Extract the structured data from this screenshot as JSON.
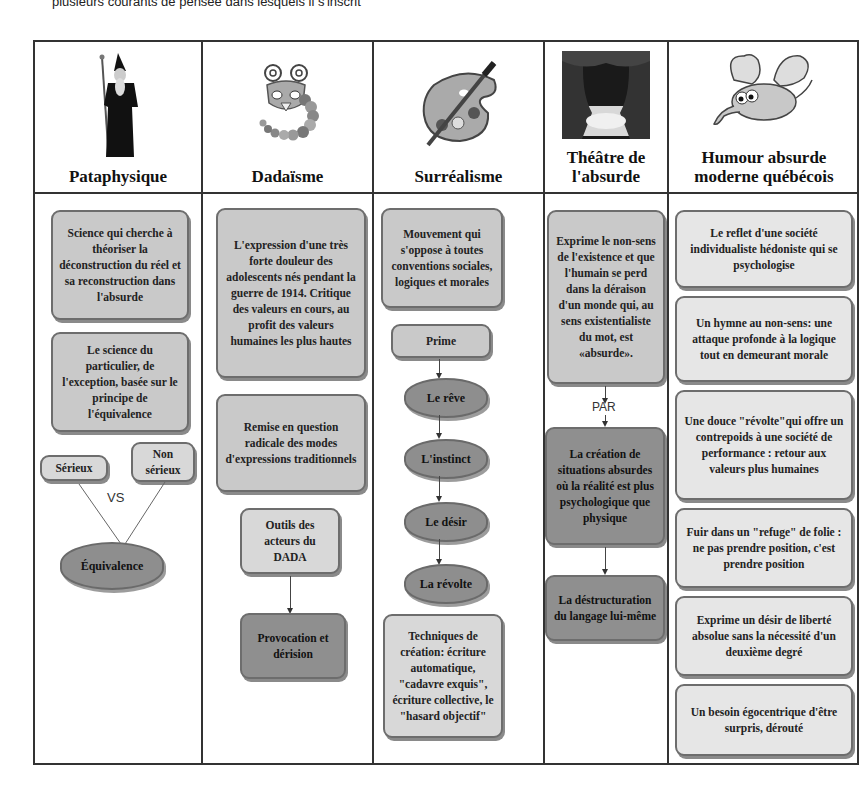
{
  "caption": "plusieurs courants de pensée dans lesquels il s'inscrit",
  "columns": [
    {
      "title": "Pataphysique",
      "icon": "wizard-figure-icon",
      "boxes": [
        "Science qui cherche à théoriser la déconstruction du réel et sa reconstruction dans l'absurde",
        "Le science du particulier, de l'exception, basée sur le principe de l'équivalence"
      ],
      "vs": {
        "left": "Sérieux",
        "right": "Non sérieux",
        "label": "VS",
        "result": "Équivalence"
      }
    },
    {
      "title": "Dadaïsme",
      "icon": "caterpillar-creature-icon",
      "boxes": [
        "L'expression d'une très forte douleur des adolescents nés pendant la guerre de 1914. Critique des valeurs en cours, au profit des valeurs humaines les plus hautes",
        "Remise en question radicale des modes d'expressions traditionnels"
      ],
      "tools": "Outils des acteurs du DADA",
      "tools_result": "Provocation et dérision"
    },
    {
      "title": "Surréalisme",
      "icon": "paint-palette-icon",
      "boxes": [
        "Mouvement qui s'oppose à toutes conventions sociales, logiques et morales"
      ],
      "prime": "Prime",
      "chain": [
        "Le rêve",
        "L'instinct",
        "Le désir",
        "La révolte"
      ],
      "techniques": "Techniques de création: écriture automatique, \"cadavre exquis\", écriture collective, le \"hasard objectif\""
    },
    {
      "title": "Théâtre de l'absurde",
      "icon": "theatre-curtain-icon",
      "boxes": [
        "Exprime le non-sens de l'existence et que l'humain se perd dans la déraison d'un monde qui, au sens existentialiste du mot, est «absurde»."
      ],
      "connector": "PAR",
      "result1": "La création de situations absurdes où la réalité est plus psychologique que physique",
      "result2": "La déstructuration du langage lui-même"
    },
    {
      "title": "Humour absurde moderne québécois",
      "icon": "flying-elephant-icon",
      "boxes": [
        "Le reflet d'une société individualiste hédoniste qui se psychologise",
        "Un hymne au non-sens: une attaque profonde à la logique tout en demeurant morale",
        "Une douce \"révolte\"qui offre un contrepoids à une société de performance : retour aux valeurs plus humaines",
        "Fuir dans un \"refuge\" de folie : ne pas prendre position, c'est prendre position",
        "Exprime un désir de liberté absolue sans la nécessité d'un deuxième degré",
        "Un besoin égocentrique d'être surpris, dérouté"
      ]
    }
  ]
}
